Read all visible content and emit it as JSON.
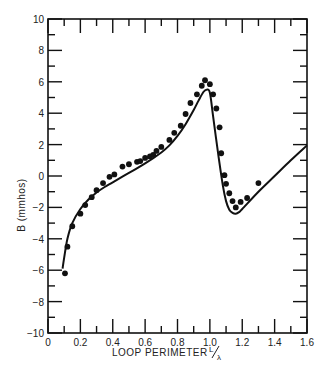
{
  "chart_data": {
    "type": "line",
    "title": "",
    "xlabel": "LOOP PERIMETER L/λ",
    "xlabel_main": "LOOP PERIMETER",
    "xlabel_frac_num": "L",
    "xlabel_frac_den": "λ",
    "ylabel": "B (mmhos)",
    "xlim": [
      0,
      1.6
    ],
    "ylim": [
      -10,
      10
    ],
    "grid": false,
    "legend": null,
    "x_ticks": [
      0,
      0.2,
      0.4,
      0.6,
      0.8,
      1.0,
      1.2,
      1.4,
      1.6
    ],
    "x_tick_labels": [
      "0",
      "0.2",
      "0.4",
      "0.6",
      "0.8",
      "1.0",
      "1.2",
      "1.4",
      "1.6"
    ],
    "y_ticks": [
      10,
      8,
      6,
      4,
      2,
      0,
      -2,
      -4,
      -6,
      -8,
      -10
    ],
    "y_tick_labels": [
      "10",
      "8",
      "6",
      "4",
      "2",
      "0",
      "−2",
      "−4",
      "−6",
      "−8",
      "−10"
    ],
    "series": [
      {
        "name": "theoretical",
        "style": "solid line",
        "x": [
          0.09,
          0.1,
          0.12,
          0.15,
          0.2,
          0.25,
          0.3,
          0.35,
          0.4,
          0.5,
          0.6,
          0.7,
          0.75,
          0.8,
          0.85,
          0.9,
          0.93,
          0.96,
          0.98,
          1.0,
          1.02,
          1.05,
          1.08,
          1.1,
          1.12,
          1.14,
          1.16,
          1.18,
          1.2,
          1.3,
          1.4,
          1.5,
          1.6
        ],
        "values": [
          -5.9,
          -5.2,
          -4.0,
          -3.0,
          -2.1,
          -1.5,
          -1.05,
          -0.7,
          -0.4,
          0.2,
          0.8,
          1.5,
          1.95,
          2.55,
          3.3,
          4.2,
          4.8,
          5.35,
          5.5,
          5.3,
          3.8,
          1.5,
          -0.6,
          -1.6,
          -2.15,
          -2.35,
          -2.4,
          -2.3,
          -2.1,
          -1.0,
          0.0,
          1.0,
          1.95
        ]
      },
      {
        "name": "measured",
        "style": "filled circles",
        "x": [
          0.105,
          0.12,
          0.15,
          0.2,
          0.23,
          0.27,
          0.3,
          0.34,
          0.38,
          0.41,
          0.46,
          0.5,
          0.55,
          0.57,
          0.6,
          0.63,
          0.65,
          0.67,
          0.7,
          0.75,
          0.78,
          0.82,
          0.85,
          0.88,
          0.92,
          0.95,
          0.97,
          1.0,
          1.02,
          1.04,
          1.06,
          1.07,
          1.09,
          1.1,
          1.12,
          1.14,
          1.16,
          1.19,
          1.23,
          1.3
        ],
        "values": [
          -6.2,
          -4.5,
          -3.2,
          -2.4,
          -1.85,
          -1.35,
          -0.9,
          -0.45,
          -0.05,
          0.1,
          0.6,
          0.75,
          0.9,
          0.95,
          1.15,
          1.25,
          1.35,
          1.6,
          1.85,
          2.3,
          2.75,
          3.2,
          3.95,
          4.65,
          5.2,
          5.75,
          6.1,
          5.85,
          5.2,
          4.3,
          3.1,
          1.45,
          0.05,
          -0.5,
          -1.1,
          -1.6,
          -2.0,
          -1.65,
          -1.4,
          -0.45
        ]
      }
    ]
  },
  "colors": {
    "ink": "#111111",
    "background": "#ffffff"
  }
}
